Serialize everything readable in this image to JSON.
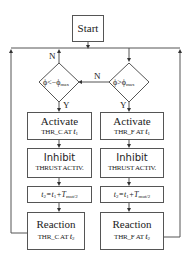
{
  "start": {
    "label": "Start"
  },
  "decisions": {
    "left": {
      "text": "ϕ<−ϕ",
      "sub": "max"
    },
    "right": {
      "text": "ϕ>ϕ",
      "sub": "max"
    }
  },
  "edge_labels": {
    "n_left": "N",
    "n_mid": "N",
    "y_left": "Y",
    "y_right": "Y"
  },
  "left_column": {
    "activate": {
      "title": "Activate",
      "detail": "THR_C AT",
      "t": "t",
      "tsub": "1"
    },
    "inhibit": {
      "title": "Inhibit",
      "detail": "THRUST ACTIV."
    },
    "timing": {
      "a": "t",
      "asub": "2",
      "mid": "=t",
      "msub": "1",
      "plus": "+T",
      "psub": "mut/2"
    },
    "reaction": {
      "title": "Reaction",
      "detail": "THR_C AT",
      "t": "t",
      "tsub": "2"
    }
  },
  "right_column": {
    "activate": {
      "title": "Activate",
      "detail": "THR_F AT",
      "t": "t",
      "tsub": "1"
    },
    "inhibit": {
      "title": "Inhibit",
      "detail": "THRUST ACTIV."
    },
    "timing": {
      "a": "t",
      "asub": "2",
      "mid": "=t",
      "msub": "1",
      "plus": "+T",
      "psub": "mut/2"
    },
    "reaction": {
      "title": "Reaction",
      "detail": "THR_F AT",
      "t": "t",
      "tsub": "2"
    }
  }
}
